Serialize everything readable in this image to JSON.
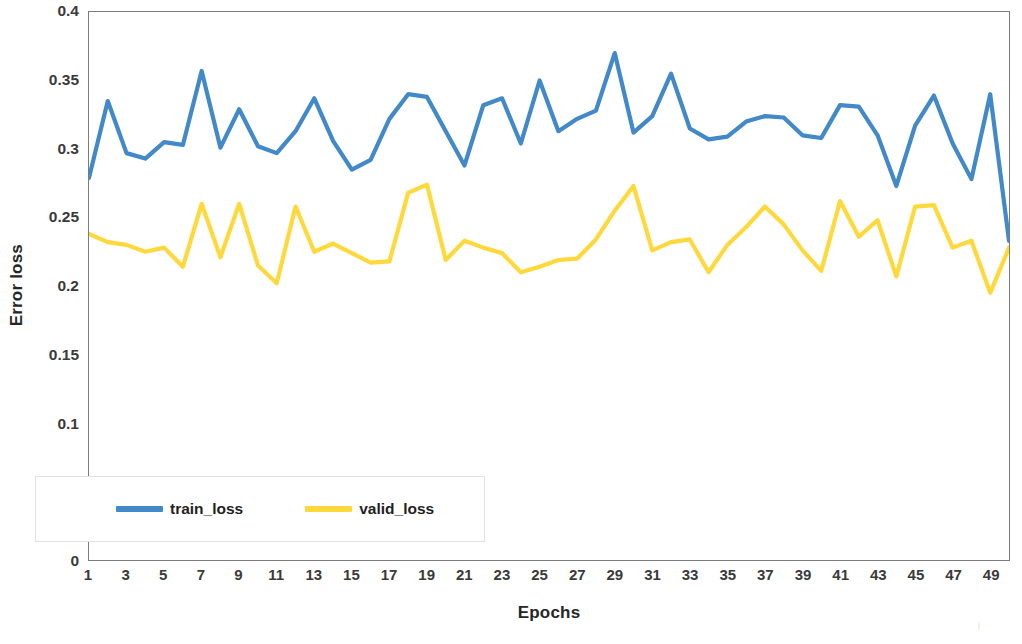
{
  "chart_data": {
    "type": "line",
    "title": "",
    "xlabel": "Epochs",
    "ylabel": "Error loss",
    "grid": false,
    "legend_position": "bottom-left-inside",
    "xlim": [
      1,
      50
    ],
    "ylim": [
      0,
      0.4
    ],
    "y_ticks": [
      "0",
      "0.05",
      "0.1",
      "0.15",
      "0.2",
      "0.25",
      "0.3",
      "0.35",
      "0.4"
    ],
    "y_tick_values": [
      0,
      0.05,
      0.1,
      0.15,
      0.2,
      0.25,
      0.3,
      0.35,
      0.4
    ],
    "x_ticks": [
      "1",
      "3",
      "5",
      "7",
      "9",
      "11",
      "13",
      "15",
      "17",
      "19",
      "21",
      "23",
      "25",
      "27",
      "29",
      "31",
      "33",
      "35",
      "37",
      "39",
      "41",
      "43",
      "45",
      "47",
      "49"
    ],
    "x_tick_values": [
      1,
      3,
      5,
      7,
      9,
      11,
      13,
      15,
      17,
      19,
      21,
      23,
      25,
      27,
      29,
      31,
      33,
      35,
      37,
      39,
      41,
      43,
      45,
      47,
      49
    ],
    "x": [
      1,
      2,
      3,
      4,
      5,
      6,
      7,
      8,
      9,
      10,
      11,
      12,
      13,
      14,
      15,
      16,
      17,
      18,
      19,
      20,
      21,
      22,
      23,
      24,
      25,
      26,
      27,
      28,
      29,
      30,
      31,
      32,
      33,
      34,
      35,
      36,
      37,
      38,
      39,
      40,
      41,
      42,
      43,
      44,
      45,
      46,
      47,
      48,
      49,
      50
    ],
    "series": [
      {
        "name": "train_loss",
        "color": "#4189C8",
        "values": [
          0.279,
          0.335,
          0.297,
          0.293,
          0.305,
          0.303,
          0.357,
          0.301,
          0.329,
          0.302,
          0.297,
          0.313,
          0.337,
          0.306,
          0.285,
          0.292,
          0.322,
          0.34,
          0.338,
          0.313,
          0.288,
          0.332,
          0.337,
          0.304,
          0.35,
          0.313,
          0.322,
          0.328,
          0.37,
          0.312,
          0.324,
          0.355,
          0.315,
          0.307,
          0.309,
          0.32,
          0.324,
          0.323,
          0.31,
          0.308,
          0.332,
          0.331,
          0.31,
          0.273,
          0.317,
          0.339,
          0.304,
          0.278,
          0.34,
          0.233
        ]
      },
      {
        "name": "valid_loss",
        "color": "#FFD93B",
        "values": [
          0.238,
          0.232,
          0.23,
          0.225,
          0.228,
          0.214,
          0.26,
          0.221,
          0.26,
          0.215,
          0.202,
          0.258,
          0.225,
          0.231,
          0.224,
          0.217,
          0.218,
          0.268,
          0.274,
          0.219,
          0.233,
          0.228,
          0.224,
          0.21,
          0.214,
          0.219,
          0.22,
          0.234,
          0.255,
          0.273,
          0.226,
          0.232,
          0.234,
          0.21,
          0.23,
          0.243,
          0.258,
          0.245,
          0.226,
          0.211,
          0.262,
          0.236,
          0.248,
          0.207,
          0.258,
          0.259,
          0.228,
          0.233,
          0.231,
          0.228
        ]
      }
    ],
    "last_valid_dip": 0.195,
    "last_valid_dip_epoch": 49
  },
  "legend": {
    "items": [
      {
        "label": "train_loss",
        "color": "#4189C8"
      },
      {
        "label": "valid_loss",
        "color": "#FFD93B"
      }
    ]
  },
  "axes": {
    "y_title": "Error loss",
    "x_title": "Epochs"
  }
}
